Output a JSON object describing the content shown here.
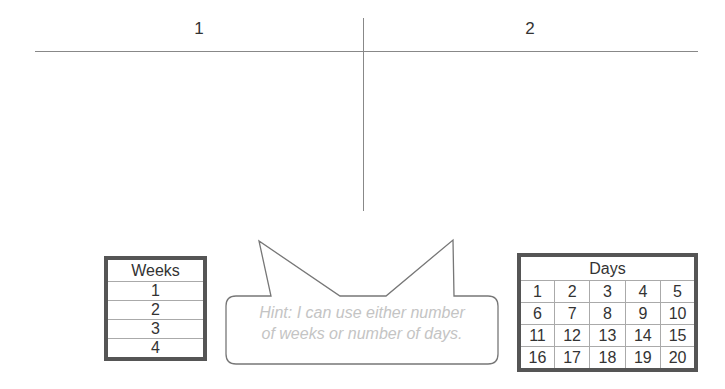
{
  "tchart": {
    "columns": [
      {
        "label": "1"
      },
      {
        "label": "2"
      }
    ]
  },
  "weeks_table": {
    "header": "Weeks",
    "rows": [
      "1",
      "2",
      "3",
      "4"
    ]
  },
  "days_table": {
    "header": "Days",
    "rows": [
      [
        "1",
        "2",
        "3",
        "4",
        "5"
      ],
      [
        "6",
        "7",
        "8",
        "9",
        "10"
      ],
      [
        "11",
        "12",
        "13",
        "14",
        "15"
      ],
      [
        "16",
        "17",
        "18",
        "19",
        "20"
      ]
    ]
  },
  "hint": {
    "line1": "Hint: I can use either number",
    "line2": "of weeks or number of days."
  },
  "colors": {
    "line": "#888888",
    "table_border": "#555555",
    "hint_text": "#c4c4c4"
  }
}
